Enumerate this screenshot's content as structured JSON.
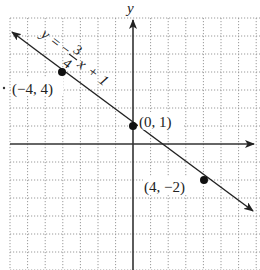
{
  "figure": {
    "axis_label_y": "y",
    "equation": "y = −¾x + 1",
    "equation_parts": {
      "lhs": "y",
      "eq": "=",
      "neg": "−",
      "num": "3",
      "den": "4",
      "var": "x",
      "plus": "+",
      "const": "1"
    },
    "points": [
      {
        "label": "(−4, 4)",
        "x": -4,
        "y": 4
      },
      {
        "label": "(0, 1)",
        "x": 0,
        "y": 1
      },
      {
        "label": "(4, −2)",
        "x": 4,
        "y": -2
      }
    ],
    "line": {
      "slope": -0.75,
      "intercept": 1
    },
    "grid": {
      "xmin": -7,
      "xmax": 7,
      "ymin": -7,
      "ymax": 7,
      "style": "dotted"
    },
    "colors": {
      "ink": "#222222",
      "grid": "#9a9a9a",
      "background": "#ffffff"
    }
  }
}
